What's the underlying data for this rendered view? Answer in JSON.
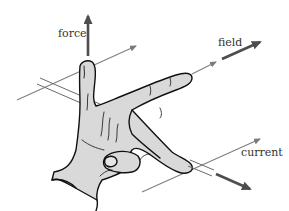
{
  "diagram": {
    "labels": {
      "force": "force",
      "field": "field",
      "current": "current"
    },
    "colors": {
      "arrow_thick": "#4d4d4d",
      "arrow_thin": "#808080",
      "hand_fill": "#d9d9d9",
      "hand_outline": "#111111",
      "text": "#333333",
      "background": "#ffffff"
    }
  }
}
